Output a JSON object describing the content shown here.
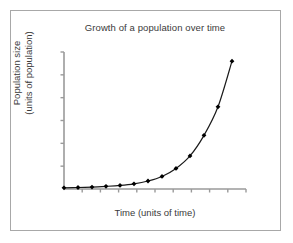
{
  "figure": {
    "background_color": "#ffffff",
    "frame_color": "#a8a8a8",
    "text_color": "#3a3a3a"
  },
  "labels": {
    "title": "Growth of a population over time",
    "ylabel_line1": "Population size",
    "ylabel_line2": "(units of population)",
    "xlabel": "Time (units of time)"
  },
  "chart_data": {
    "type": "line",
    "title": "Growth of a population over time",
    "xlabel": "Time (units of time)",
    "ylabel": "Population size (units of population)",
    "subtitle": "",
    "grid": false,
    "legend": false,
    "legend_position": "none",
    "axis_tick_labels": false,
    "xlim": [
      0,
      13
    ],
    "ylim": [
      0,
      120
    ],
    "x_tick_count": 10,
    "y_tick_count": 6,
    "marker": "filled-diamond",
    "marker_color": "#000000",
    "line_color": "#1a1a1a",
    "line_width": 1.2,
    "series": [
      {
        "name": "Population",
        "x": [
          0,
          1,
          2,
          3,
          4,
          5,
          6,
          7,
          8,
          9,
          10,
          11,
          12
        ],
        "values": [
          1,
          1.3,
          1.7,
          2.3,
          3.1,
          4.5,
          7,
          11,
          18,
          29,
          47,
          72,
          112
        ]
      }
    ]
  }
}
